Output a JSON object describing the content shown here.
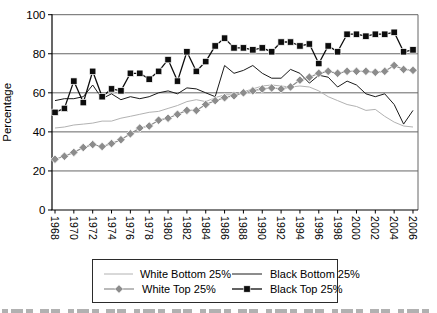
{
  "figure": {
    "y_axis_title": "Percentage",
    "y_ticks": [
      0,
      20,
      40,
      60,
      80,
      100
    ],
    "colors": {
      "grid": "#666666",
      "axis": "#000000",
      "background": "#ffffff",
      "legend_border": "#2b2b2b"
    }
  },
  "chart_data": {
    "type": "line",
    "title": "",
    "xlabel": "",
    "ylabel": "Percentage",
    "ylim": [
      0,
      100
    ],
    "grid": "horizontal",
    "legend_position": "bottom",
    "x_tick_labels_shown_every": 2,
    "x": [
      1968,
      1969,
      1970,
      1971,
      1972,
      1973,
      1974,
      1975,
      1976,
      1977,
      1978,
      1979,
      1980,
      1981,
      1982,
      1983,
      1984,
      1985,
      1986,
      1987,
      1988,
      1989,
      1990,
      1991,
      1992,
      1993,
      1994,
      1995,
      1996,
      1997,
      1998,
      1999,
      2000,
      2001,
      2002,
      2003,
      2004,
      2005,
      2006
    ],
    "series": [
      {
        "name": "White Bottom 25%",
        "color": "#b2b2b2",
        "marker": "none",
        "width": 1,
        "values": [
          42,
          42.5,
          43.5,
          44,
          44.5,
          45.5,
          45.5,
          47,
          48,
          49,
          50,
          50.5,
          52,
          53.5,
          55.5,
          56.5,
          55.5,
          57.5,
          59,
          59,
          60.5,
          62,
          63.5,
          64,
          63.5,
          63,
          63.5,
          63,
          61,
          58,
          56,
          54,
          53,
          51,
          51.5,
          48,
          45,
          43,
          42.5
        ]
      },
      {
        "name": "Black Bottom 25%",
        "color": "#1a1a1a",
        "marker": "none",
        "width": 1,
        "values": [
          56,
          57,
          57,
          58,
          64,
          57,
          59.5,
          56.5,
          58,
          57,
          58,
          60,
          61,
          59.5,
          62.5,
          62,
          60,
          58,
          74,
          70,
          71.5,
          74,
          70,
          67.5,
          67.5,
          72,
          70,
          65,
          69,
          68,
          63,
          66,
          64,
          59.5,
          58,
          59.5,
          54,
          44,
          51
        ]
      },
      {
        "name": "White Top 25%",
        "color": "#8c8c8c",
        "marker": "diamond",
        "width": 1.2,
        "values": [
          26,
          27.5,
          29.5,
          32,
          33.5,
          32.5,
          34,
          36,
          39,
          42,
          43,
          46,
          47,
          49,
          51,
          51,
          54,
          56,
          57.5,
          58.5,
          60,
          61,
          62,
          62.5,
          62,
          63,
          66.5,
          68,
          70,
          71,
          70,
          71,
          71,
          71,
          70.5,
          71,
          74,
          72,
          71.5
        ]
      },
      {
        "name": "Black Top 25%",
        "color": "#0d0d0d",
        "marker": "square",
        "width": 1.3,
        "values": [
          50,
          52,
          66,
          55,
          71,
          58,
          62,
          61,
          70,
          70,
          67,
          71,
          77,
          66,
          81,
          71,
          76,
          84,
          88,
          83,
          83,
          82,
          83,
          81,
          86,
          86,
          84,
          85,
          75,
          84,
          81,
          90,
          90,
          89,
          90,
          90,
          91,
          81,
          82
        ]
      }
    ]
  }
}
